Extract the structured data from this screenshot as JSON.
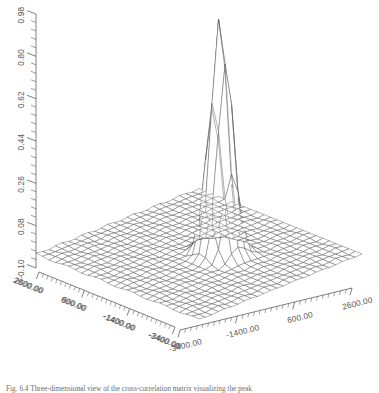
{
  "figure": {
    "kind": "3d-wireframe-surface-plot",
    "background_color": "#ffffff",
    "line_color": "#4a4a4a",
    "text_color": "#555555"
  },
  "caption": {
    "text": "Fig. 6.4 Three-dimensional view of the cross-correlation matrix visualizing the peak"
  },
  "chart_data": {
    "type": "surface",
    "title": "",
    "xlabel": "",
    "ylabel": "",
    "zlabel": "",
    "grid": true,
    "legend": "none",
    "projection": "isometric-wireframe",
    "z_axis": {
      "ticks": [
        "0.98",
        "0.80",
        "0.62",
        "0.44",
        "0.26",
        "0.08",
        "-0.10"
      ],
      "min": -0.1,
      "max": 0.98,
      "step": 0.18,
      "minor_ticks_per_major": 5
    },
    "x_axis": {
      "ticks": [
        "-3400.00",
        "-1400.00",
        "600.00",
        "2600.00"
      ],
      "min": -3400,
      "max": 2600,
      "step": 2000,
      "orientation": "front-left-to-back-left",
      "minor_ticks_per_major": 10
    },
    "y_axis": {
      "ticks": [
        "-3400.00",
        "-1400.00",
        "600.00",
        "2600.00"
      ],
      "min": -3400,
      "max": 2600,
      "step": 2000,
      "orientation": "front-right-to-back-right",
      "minor_ticks_per_major": 10
    },
    "surface": {
      "description": "Flat baseline mesh near z = 0 with a single sharp narrow central peak",
      "baseline_z": 0.0,
      "peak_z": 0.98,
      "peak_x": 0,
      "peak_y": 0,
      "peak_half_width_x": 600,
      "peak_half_width_y": 600,
      "grid_nx": 25,
      "grid_ny": 25
    },
    "x_tick_labels_left": [
      "2600.00",
      "600.00",
      "-1400.00",
      "-3400.00"
    ],
    "y_tick_labels_right": [
      "-3400.00",
      "-1400.00",
      "600.00",
      "2600.00"
    ]
  }
}
